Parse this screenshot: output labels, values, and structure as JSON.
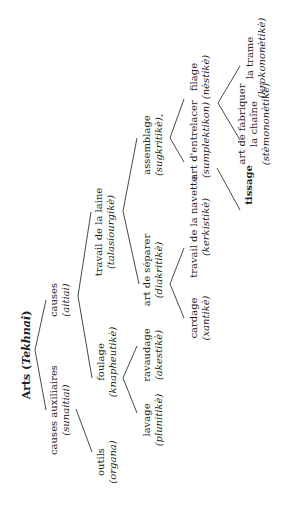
{
  "diagram": {
    "title": "Arts",
    "title_greek": "Tekhnai",
    "colors": {
      "text": "#222222",
      "line": "#333333",
      "background": "#ffffff"
    },
    "nodes": [
      {
        "id": "arts",
        "label": "Arts",
        "greek": "Tekhnai",
        "x": 27,
        "y": 355
      },
      {
        "id": "causes-auxiliaires",
        "label": "causes auxiliaires",
        "greek": "(sunaitiai)",
        "x": 60,
        "y": 410
      },
      {
        "id": "causes",
        "label": "causes",
        "greek": "(aitiai)",
        "x": 60,
        "y": 300
      },
      {
        "id": "outils",
        "label": "outils",
        "greek": "(organa)",
        "x": 107,
        "y": 462
      },
      {
        "id": "foulage",
        "label": "foulage",
        "greek": "(knapheutikè)",
        "x": 107,
        "y": 362
      },
      {
        "id": "travail-laine",
        "label": "travail de la laine",
        "greek": "(talasiourgikè)",
        "x": 105,
        "y": 232
      },
      {
        "id": "lavage",
        "label": "lavage",
        "greek": "(plunitikè)",
        "x": 153,
        "y": 420
      },
      {
        "id": "ravaudage",
        "label": "ravaudage",
        "greek": "(akestikè)",
        "x": 153,
        "y": 355
      },
      {
        "id": "art-separer",
        "label": "art de séparer",
        "greek": "(diakritikè)",
        "x": 153,
        "y": 270
      },
      {
        "id": "assemblage",
        "label": "assemblage",
        "greek": "(sugkritikè),",
        "x": 153,
        "y": 145
      },
      {
        "id": "cardage",
        "label": "cardage",
        "greek": "(xantikè)",
        "x": 200,
        "y": 318
      },
      {
        "id": "navette",
        "label": "travail de la navette",
        "greek": "(kerkistikè)",
        "x": 200,
        "y": 227
      },
      {
        "id": "entrelacer",
        "label": "art d'entrelacer",
        "greek": "(sumplektikon)",
        "x": 200,
        "y": 140
      },
      {
        "id": "filage",
        "label": "filage",
        "greek": "(nèstikè)",
        "x": 200,
        "y": 77
      },
      {
        "id": "tissage",
        "label": "tissage",
        "greek": "",
        "x": 249,
        "y": 185
      },
      {
        "id": "chaine",
        "label": "art de fabriquer",
        "label2": "la chaîne",
        "greek": "(stèmononètikè)",
        "x": 254,
        "y": 124
      },
      {
        "id": "trame",
        "label": "la trame",
        "greek": "(krokononètikè)",
        "x": 256,
        "y": 58
      }
    ],
    "edges": [
      {
        "from": "arts",
        "to": "causes-auxiliaires",
        "x1": 35,
        "y1": 350,
        "x2": 46,
        "y2": 410
      },
      {
        "from": "arts",
        "to": "causes",
        "x1": 35,
        "y1": 350,
        "x2": 46,
        "y2": 300
      },
      {
        "from": "causes-auxiliaires",
        "to": "outils",
        "x1": 76,
        "y1": 409,
        "x2": 92,
        "y2": 452
      },
      {
        "from": "causes",
        "to": "foulage",
        "x1": 78,
        "y1": 296,
        "x2": 92,
        "y2": 378
      },
      {
        "from": "causes",
        "to": "travail-laine",
        "x1": 78,
        "y1": 296,
        "x2": 91,
        "y2": 212
      },
      {
        "from": "foulage",
        "to": "lavage",
        "x1": 123,
        "y1": 378,
        "x2": 137,
        "y2": 413
      },
      {
        "from": "foulage",
        "to": "ravaudage",
        "x1": 123,
        "y1": 378,
        "x2": 137,
        "y2": 346
      },
      {
        "from": "travail-laine",
        "to": "art-separer",
        "x1": 123,
        "y1": 211,
        "x2": 139,
        "y2": 284
      },
      {
        "from": "travail-laine",
        "to": "assemblage",
        "x1": 123,
        "y1": 211,
        "x2": 137,
        "y2": 138
      },
      {
        "from": "art-separer",
        "to": "cardage",
        "x1": 170,
        "y1": 284,
        "x2": 184,
        "y2": 318
      },
      {
        "from": "art-separer",
        "to": "navette",
        "x1": 170,
        "y1": 284,
        "x2": 184,
        "y2": 248
      },
      {
        "from": "assemblage",
        "to": "entrelacer",
        "x1": 170,
        "y1": 138,
        "x2": 184,
        "y2": 162
      },
      {
        "from": "assemblage",
        "to": "filage",
        "x1": 170,
        "y1": 138,
        "x2": 184,
        "y2": 99
      },
      {
        "from": "entrelacer",
        "to": "tissage",
        "x1": 217,
        "y1": 168,
        "x2": 240,
        "y2": 210
      },
      {
        "from": "filage",
        "to": "chaine",
        "x1": 218,
        "y1": 103,
        "x2": 240,
        "y2": 140
      },
      {
        "from": "filage",
        "to": "trame",
        "x1": 218,
        "y1": 103,
        "x2": 240,
        "y2": 66
      }
    ]
  }
}
